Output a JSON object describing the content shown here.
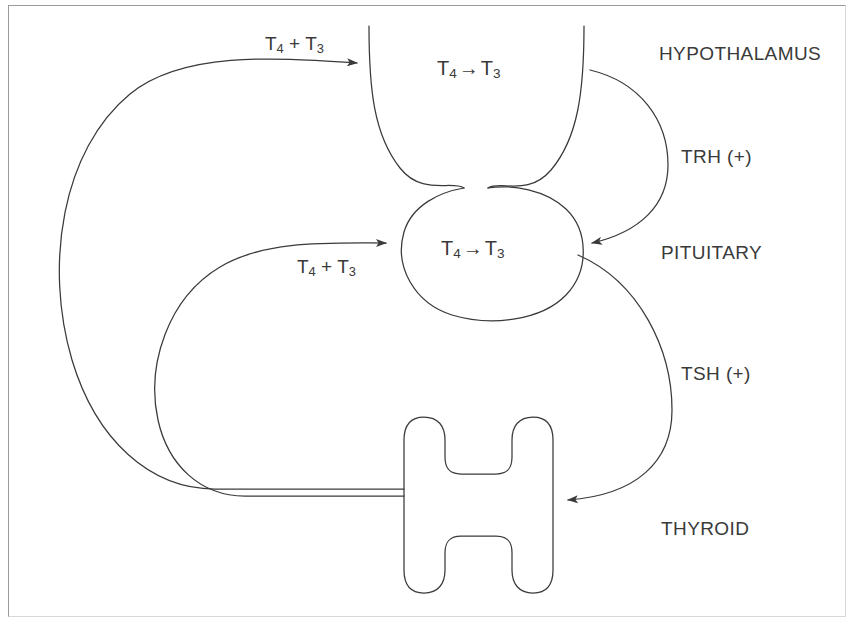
{
  "figure": {
    "background_color": "#ffffff",
    "line_color": "#3a3a3a",
    "frame_color": "#9a9a9a"
  },
  "organs": [
    {
      "id": "hypothalamus",
      "label": "HYPOTHALAMUS",
      "conversion": "T₄ → T₃"
    },
    {
      "id": "pituitary",
      "label": "PITUITARY",
      "conversion": "T₄ → T₃"
    },
    {
      "id": "thyroid",
      "label": "THYROID",
      "conversion": ""
    }
  ],
  "conversions": [
    {
      "id": "hypothalamus-conversion",
      "from": "T4",
      "to": "T3",
      "t4": "T",
      "t4_sub": "4",
      "arrow": "→",
      "t3": "T",
      "t3_sub": "3"
    },
    {
      "id": "pituitary-conversion",
      "from": "T4",
      "to": "T3",
      "t4": "T",
      "t4_sub": "4",
      "arrow": "→",
      "t3": "T",
      "t3_sub": "3"
    }
  ],
  "signals": [
    {
      "id": "trh",
      "label": "TRH (+)",
      "sign": "+",
      "source": "hypothalamus",
      "target": "pituitary"
    },
    {
      "id": "tsh",
      "label": "TSH (+)",
      "sign": "+",
      "source": "pituitary",
      "target": "thyroid"
    }
  ],
  "feedback": [
    {
      "id": "feedback-to-hypothalamus",
      "t4": "T",
      "t4_sub": "4",
      "plus": "+",
      "t3": "T",
      "t3_sub": "3",
      "label": "T₄ + T₃",
      "source": "thyroid",
      "target": "hypothalamus",
      "effect": "negative"
    },
    {
      "id": "feedback-to-pituitary",
      "t4": "T",
      "t4_sub": "4",
      "plus": "+",
      "t3": "T",
      "t3_sub": "3",
      "label": "T₄ + T₃",
      "source": "thyroid",
      "target": "pituitary",
      "effect": "negative"
    }
  ]
}
